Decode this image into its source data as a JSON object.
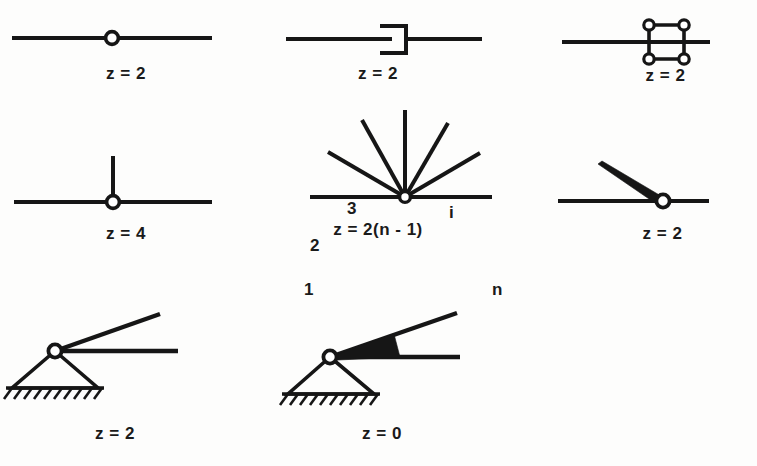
{
  "figure": {
    "background_color": "#fdfdfc",
    "ink_color": "#161616"
  },
  "cells": [
    {
      "id": "pin-joint-binary",
      "name": "binary-revolute-joint",
      "label": "z = 2",
      "icon": "revolute-joint-icon"
    },
    {
      "id": "prismatic-joint",
      "name": "prismatic-slider-joint",
      "label": "z = 2",
      "icon": "prismatic-joint-icon"
    },
    {
      "id": "parallelogram-loop",
      "name": "four-bar-parallelogram-loop",
      "label": "z = 2",
      "icon": "parallelogram-loop-icon"
    },
    {
      "id": "tee-joint",
      "name": "ternary-tee-joint",
      "label": "z = 4",
      "icon": "tee-joint-icon"
    },
    {
      "id": "multi-ray-hub",
      "name": "n-ary-joint-hub",
      "label": "z = 2(n - 1)",
      "icon": "multi-ray-joint-icon",
      "ray_labels": [
        "1",
        "2",
        "3",
        "i",
        "n"
      ]
    },
    {
      "id": "wedge-joint",
      "name": "tapered-link-revolute-joint",
      "label": "z = 2",
      "icon": "tapered-link-joint-icon"
    },
    {
      "id": "grounded-pin",
      "name": "grounded-pivot-two-links",
      "label": "z = 2",
      "icon": "ground-pivot-icon"
    },
    {
      "id": "grounded-rigid",
      "name": "grounded-rigid-welded-links",
      "label": "z = 0",
      "icon": "ground-rigid-joint-icon"
    }
  ]
}
